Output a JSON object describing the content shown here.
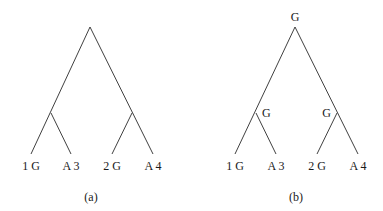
{
  "figure": {
    "panels": [
      {
        "id": "a",
        "caption": "(a)",
        "root_label": "",
        "internal_labels": [
          "",
          ""
        ],
        "leaves": [
          {
            "num": "1",
            "state": "G",
            "text": "1 G"
          },
          {
            "num": "3",
            "state": "A",
            "text": "A 3"
          },
          {
            "num": "2",
            "state": "G",
            "text": "2 G"
          },
          {
            "num": "4",
            "state": "A",
            "text": "A 4"
          }
        ]
      },
      {
        "id": "b",
        "caption": "(b)",
        "root_label": "G",
        "internal_labels": [
          "G",
          "G"
        ],
        "leaves": [
          {
            "num": "1",
            "state": "G",
            "text": "1 G"
          },
          {
            "num": "3",
            "state": "A",
            "text": "A 3"
          },
          {
            "num": "2",
            "state": "G",
            "text": "2 G"
          },
          {
            "num": "4",
            "state": "A",
            "text": "A 4"
          }
        ]
      }
    ]
  },
  "colors": {
    "background": "#ffffff",
    "line": "#2a2a2a",
    "text": "#1a1a1a"
  }
}
